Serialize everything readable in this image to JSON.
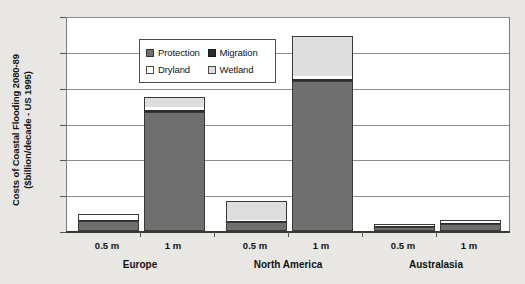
{
  "chart_data": {
    "type": "bar",
    "title": "",
    "subtitle": "",
    "stacked": true,
    "xlabel": "",
    "ylabel_line1": "Costs of Coastal Flooding 2080-89",
    "ylabel_line2": "($billion/decade - US 1995)",
    "ylim": [
      0,
      12
    ],
    "ytick_values": [
      0,
      2,
      4,
      6,
      8,
      10,
      12
    ],
    "ytick_labels": [
      "$0",
      "$2",
      "$4",
      "$6",
      "$8",
      "$10",
      "$12"
    ],
    "grid": true,
    "grid_axis": "y",
    "legend_position": "top-left-inside",
    "categories": [
      "0.5 m",
      "1 m",
      "0.5 m",
      "1 m",
      "0.5 m",
      "1 m"
    ],
    "groups": [
      {
        "label": "Europe",
        "scenarios": [
          "0.5 m",
          "1 m"
        ]
      },
      {
        "label": "North America",
        "scenarios": [
          "0.5 m",
          "1 m"
        ]
      },
      {
        "label": "Australasia",
        "scenarios": [
          "0.5 m",
          "1 m"
        ]
      }
    ],
    "series": [
      {
        "name": "Protection",
        "color": "#6f6f6f",
        "values": [
          0.55,
          6.65,
          0.48,
          8.38,
          0.2,
          0.4
        ]
      },
      {
        "name": "Migration",
        "color": "#2b2b2b",
        "values": [
          0.03,
          0.13,
          0.03,
          0.12,
          0.02,
          0.02
        ]
      },
      {
        "name": "Dryland",
        "color": "#ffffff",
        "values": [
          0.27,
          0.17,
          0.05,
          0.13,
          0.02,
          0.02
        ]
      },
      {
        "name": "Wetland",
        "color": "#dedede",
        "values": [
          0.03,
          0.55,
          1.04,
          2.27,
          0.01,
          0.01
        ]
      }
    ],
    "totals": [
      0.88,
      7.5,
      1.6,
      10.9,
      0.25,
      0.45
    ]
  },
  "legend": {
    "items": [
      {
        "label": "Protection",
        "swatch": "protection"
      },
      {
        "label": "Migration",
        "swatch": "migration"
      },
      {
        "label": "Dryland",
        "swatch": "dryland"
      },
      {
        "label": "Wetland",
        "swatch": "wetland"
      }
    ]
  },
  "colors": {
    "background": "#e9e7e3",
    "plot_background": "#ffffff",
    "gridline": "#8c8c8c",
    "axis": "#3a3a3a",
    "text": "#111111"
  }
}
